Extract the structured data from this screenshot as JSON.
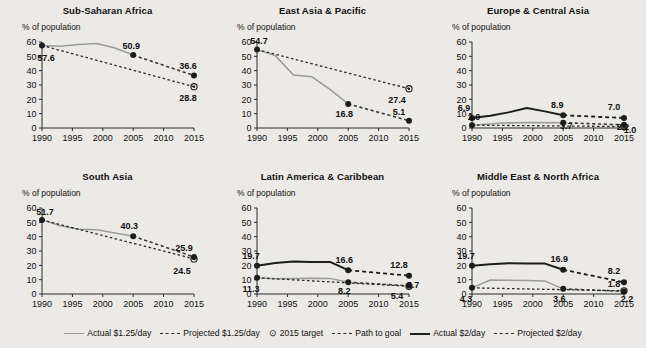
{
  "axis": {
    "y_label": "% of population",
    "y_ticks": [
      0,
      10,
      20,
      30,
      40,
      50,
      60
    ],
    "x_ticks": [
      1990,
      1995,
      2000,
      2005,
      2010,
      2015
    ],
    "ylim": [
      0,
      60
    ],
    "xlim": [
      1990,
      2015
    ]
  },
  "legend": {
    "position": "bottom-center",
    "items": [
      {
        "label": "Actual $1.25/day",
        "style": "solid-gray"
      },
      {
        "label": "Projected $1.25/day",
        "style": "dash-gray2"
      },
      {
        "label": "2015 target",
        "style": "target-marker",
        "glyph": "⊙"
      },
      {
        "label": "Path to goal",
        "style": "pathg"
      },
      {
        "label": "Actual $2/day",
        "style": "solid-dark"
      },
      {
        "label": "Projected $2/day",
        "style": "dash-dark2"
      }
    ]
  },
  "chart_data": {
    "type": "line",
    "title": "",
    "xlabel": "",
    "ylabel": "% of population",
    "xlim": [
      1990,
      2015
    ],
    "ylim": [
      0,
      60
    ],
    "grid": false,
    "panels": [
      {
        "title": "Sub-Saharan Africa",
        "series": [
          {
            "name": "Actual $1.25/day",
            "style": "solid-gray",
            "points": [
              [
                1990,
                57.6
              ],
              [
                1993,
                57.0
              ],
              [
                1996,
                58.2
              ],
              [
                1999,
                58.9
              ],
              [
                2002,
                55.8
              ],
              [
                2005,
                50.9
              ]
            ],
            "labels": [
              {
                "x": 1990,
                "y": 57.6,
                "text": "57.6"
              },
              {
                "x": 2005,
                "y": 50.9,
                "text": "50.9"
              }
            ]
          },
          {
            "name": "Projected $1.25/day",
            "style": "dash-gray2",
            "points": [
              [
                2005,
                50.9
              ],
              [
                2015,
                36.6
              ]
            ],
            "labels": [
              {
                "x": 2015,
                "y": 36.6,
                "text": "36.6"
              }
            ]
          },
          {
            "name": "Path to goal",
            "style": "pathg",
            "points": [
              [
                1990,
                57.6
              ],
              [
                2015,
                28.8
              ]
            ]
          },
          {
            "name": "2015 target",
            "style": "target-marker",
            "points": [
              [
                2015,
                28.8
              ]
            ],
            "labels": [
              {
                "x": 2015,
                "y": 28.8,
                "text": "28.8"
              }
            ]
          }
        ]
      },
      {
        "title": "East Asia & Pacific",
        "series": [
          {
            "name": "Actual $1.25/day",
            "style": "solid-gray",
            "points": [
              [
                1990,
                54.7
              ],
              [
                1993,
                50.5
              ],
              [
                1996,
                37.0
              ],
              [
                1999,
                35.8
              ],
              [
                2002,
                27.0
              ],
              [
                2005,
                16.8
              ]
            ],
            "labels": [
              {
                "x": 1990,
                "y": 54.7,
                "text": "54.7"
              },
              {
                "x": 2005,
                "y": 16.8,
                "text": "16.8"
              }
            ]
          },
          {
            "name": "Projected $1.25/day",
            "style": "dash-gray2",
            "points": [
              [
                2005,
                16.8
              ],
              [
                2015,
                5.1
              ]
            ],
            "labels": [
              {
                "x": 2015,
                "y": 5.1,
                "text": "5.1"
              }
            ]
          },
          {
            "name": "Path to goal",
            "style": "pathg",
            "points": [
              [
                1990,
                54.7
              ],
              [
                2015,
                27.4
              ]
            ]
          },
          {
            "name": "2015 target",
            "style": "target-marker",
            "points": [
              [
                2015,
                27.4
              ]
            ],
            "labels": [
              {
                "x": 2015,
                "y": 27.4,
                "text": "27.4"
              }
            ]
          }
        ]
      },
      {
        "title": "Europe & Central Asia",
        "series": [
          {
            "name": "Actual $2/day",
            "style": "solid-dark",
            "points": [
              [
                1990,
                6.9
              ],
              [
                1993,
                8.6
              ],
              [
                1996,
                10.9
              ],
              [
                1999,
                13.9
              ],
              [
                2002,
                11.6
              ],
              [
                2005,
                8.9
              ]
            ],
            "labels": [
              {
                "x": 1990,
                "y": 6.9,
                "text": "6.9"
              },
              {
                "x": 2005,
                "y": 8.9,
                "text": "8.9"
              }
            ]
          },
          {
            "name": "Projected $2/day",
            "style": "dash-dark2",
            "points": [
              [
                2005,
                8.9
              ],
              [
                2015,
                7.0
              ]
            ],
            "labels": [
              {
                "x": 2015,
                "y": 7.0,
                "text": "7.0"
              }
            ]
          },
          {
            "name": "Actual $1.25/day",
            "style": "solid-gray",
            "points": [
              [
                1990,
                2.0
              ],
              [
                1995,
                3.5
              ],
              [
                2000,
                3.9
              ],
              [
                2005,
                3.7
              ]
            ],
            "labels": [
              {
                "x": 1990,
                "y": 2.0,
                "text": "2.0"
              },
              {
                "x": 2005,
                "y": 3.7,
                "text": "3.7"
              }
            ]
          },
          {
            "name": "Projected $1.25/day",
            "style": "dash-gray2",
            "points": [
              [
                2005,
                3.7
              ],
              [
                2015,
                2.2
              ]
            ],
            "labels": [
              {
                "x": 2015,
                "y": 2.2,
                "text": "2.2"
              }
            ]
          },
          {
            "name": "Path to goal",
            "style": "pathg",
            "points": [
              [
                1990,
                2.0
              ],
              [
                2015,
                1.0
              ]
            ]
          },
          {
            "name": "2015 target",
            "style": "target-marker",
            "points": [
              [
                2015,
                1.0
              ]
            ],
            "labels": [
              {
                "x": 2015,
                "y": 1.0,
                "text": "1.0"
              }
            ]
          }
        ]
      },
      {
        "title": "South Asia",
        "series": [
          {
            "name": "Actual $1.25/day",
            "style": "solid-gray",
            "points": [
              [
                1990,
                51.7
              ],
              [
                1993,
                47.6
              ],
              [
                1996,
                45.1
              ],
              [
                1999,
                44.8
              ],
              [
                2002,
                42.6
              ],
              [
                2005,
                40.3
              ]
            ],
            "labels": [
              {
                "x": 1990,
                "y": 51.7,
                "text": "51.7"
              },
              {
                "x": 2005,
                "y": 40.3,
                "text": "40.3"
              }
            ]
          },
          {
            "name": "Projected $1.25/day",
            "style": "dash-gray2",
            "points": [
              [
                2005,
                40.3
              ],
              [
                2015,
                25.9
              ]
            ],
            "labels": [
              {
                "x": 2015,
                "y": 25.9,
                "text": "25.9"
              }
            ]
          },
          {
            "name": "Path to goal",
            "style": "pathg",
            "points": [
              [
                1990,
                51.7
              ],
              [
                2015,
                24.5
              ]
            ]
          },
          {
            "name": "2015 target",
            "style": "target-marker",
            "points": [
              [
                2015,
                24.5
              ]
            ],
            "labels": [
              {
                "x": 2015,
                "y": 24.5,
                "text": "24.5"
              }
            ]
          }
        ]
      },
      {
        "title": "Latin America & Caribbean",
        "series": [
          {
            "name": "Actual $2/day",
            "style": "solid-dark",
            "points": [
              [
                1990,
                19.7
              ],
              [
                1993,
                21.6
              ],
              [
                1996,
                22.6
              ],
              [
                1999,
                22.4
              ],
              [
                2002,
                22.4
              ],
              [
                2005,
                16.6
              ]
            ],
            "labels": [
              {
                "x": 1990,
                "y": 19.7,
                "text": "19.7"
              },
              {
                "x": 2005,
                "y": 16.6,
                "text": "16.6"
              }
            ]
          },
          {
            "name": "Projected $2/day",
            "style": "dash-dark2",
            "points": [
              [
                2005,
                16.6
              ],
              [
                2015,
                12.8
              ]
            ],
            "labels": [
              {
                "x": 2015,
                "y": 12.8,
                "text": "12.8"
              }
            ]
          },
          {
            "name": "Actual $1.25/day",
            "style": "solid-gray",
            "points": [
              [
                1990,
                11.3
              ],
              [
                1993,
                10.6
              ],
              [
                1996,
                10.8
              ],
              [
                1999,
                11.0
              ],
              [
                2002,
                10.9
              ],
              [
                2005,
                8.2
              ]
            ],
            "labels": [
              {
                "x": 1990,
                "y": 11.3,
                "text": "11.3"
              },
              {
                "x": 2005,
                "y": 8.2,
                "text": "8.2"
              }
            ]
          },
          {
            "name": "Projected $1.25/day",
            "style": "dash-gray2",
            "points": [
              [
                2005,
                8.2
              ],
              [
                2015,
                5.7
              ]
            ],
            "labels": [
              {
                "x": 2015,
                "y": 5.7,
                "text": "5.7"
              }
            ]
          },
          {
            "name": "Path to goal",
            "style": "pathg",
            "points": [
              [
                1990,
                11.3
              ],
              [
                2015,
                5.4
              ]
            ]
          },
          {
            "name": "2015 target",
            "style": "target-marker",
            "points": [
              [
                2015,
                5.4
              ]
            ],
            "labels": [
              {
                "x": 2015,
                "y": 5.4,
                "text": "5.4"
              }
            ]
          }
        ]
      },
      {
        "title": "Middle East & North Africa",
        "series": [
          {
            "name": "Actual $2/day",
            "style": "solid-dark",
            "points": [
              [
                1990,
                19.7
              ],
              [
                1993,
                20.8
              ],
              [
                1996,
                21.4
              ],
              [
                1999,
                21.3
              ],
              [
                2002,
                21.2
              ],
              [
                2005,
                16.9
              ]
            ],
            "labels": [
              {
                "x": 1990,
                "y": 19.7,
                "text": "19.7"
              },
              {
                "x": 2005,
                "y": 16.9,
                "text": "16.9"
              }
            ]
          },
          {
            "name": "Projected $2/day",
            "style": "dash-dark2",
            "points": [
              [
                2005,
                16.9
              ],
              [
                2015,
                8.2
              ]
            ],
            "labels": [
              {
                "x": 2015,
                "y": 8.2,
                "text": "8.2"
              }
            ]
          },
          {
            "name": "Actual $1.25/day",
            "style": "solid-gray",
            "points": [
              [
                1990,
                4.3
              ],
              [
                1993,
                9.8
              ],
              [
                1996,
                9.6
              ],
              [
                1999,
                9.4
              ],
              [
                2002,
                9.0
              ],
              [
                2005,
                3.6
              ]
            ],
            "labels": [
              {
                "x": 1990,
                "y": 4.3,
                "text": "4.3"
              },
              {
                "x": 2005,
                "y": 3.6,
                "text": "3.6"
              }
            ]
          },
          {
            "name": "Projected $1.25/day",
            "style": "dash-gray2",
            "points": [
              [
                2005,
                3.6
              ],
              [
                2015,
                1.8
              ]
            ],
            "labels": [
              {
                "x": 2015,
                "y": 1.8,
                "text": "1.8"
              }
            ]
          },
          {
            "name": "Path to goal",
            "style": "pathg",
            "points": [
              [
                1990,
                4.3
              ],
              [
                2015,
                2.2
              ]
            ]
          },
          {
            "name": "2015 target",
            "style": "target-marker",
            "points": [
              [
                2015,
                2.2
              ]
            ],
            "labels": [
              {
                "x": 2015,
                "y": 2.2,
                "text": "2.2"
              }
            ]
          }
        ]
      }
    ]
  },
  "label_offsets": {
    "Sub-Saharan Africa": {
      "57.6": [
        4,
        16
      ],
      "50.9": [
        -2,
        -6
      ],
      "36.6": [
        -6,
        -7
      ],
      "28.8": [
        -6,
        14
      ]
    },
    "East Asia & Pacific": {
      "54.7": [
        2,
        -6
      ],
      "16.8": [
        -4,
        13
      ],
      "5.1": [
        -10,
        -6
      ],
      "27.4": [
        -12,
        14
      ]
    },
    "Europe & Central Asia": {
      "6.9": [
        -8,
        -7
      ],
      "8.9": [
        -6,
        -7
      ],
      "7.0": [
        -10,
        -8
      ],
      "2.0": [
        2,
        -5
      ],
      "3.7": [
        3,
        6
      ],
      "2.2": [
        -1,
        5
      ],
      "1.0": [
        6,
        6
      ]
    },
    "South Asia": {
      "51.7": [
        3,
        -5
      ],
      "40.3": [
        -4,
        -7
      ],
      "25.9": [
        -10,
        -6
      ],
      "24.5": [
        -12,
        15
      ]
    },
    "Latin America & Caribbean": {
      "19.7": [
        -6,
        -7
      ],
      "16.6": [
        -4,
        -7
      ],
      "12.8": [
        -10,
        -8
      ],
      "11.3": [
        -6,
        14
      ],
      "8.2": [
        -4,
        12
      ],
      "5.7": [
        4,
        2
      ],
      "5.4": [
        -12,
        13
      ]
    },
    "Middle East & North Africa": {
      "19.7": [
        -6,
        -7
      ],
      "16.9": [
        -4,
        -8
      ],
      "8.2": [
        -10,
        -8
      ],
      "4.3": [
        -6,
        14
      ],
      "3.6": [
        -4,
        13
      ],
      "1.8": [
        -10,
        -4
      ],
      "2.2": [
        3,
        11
      ]
    }
  }
}
